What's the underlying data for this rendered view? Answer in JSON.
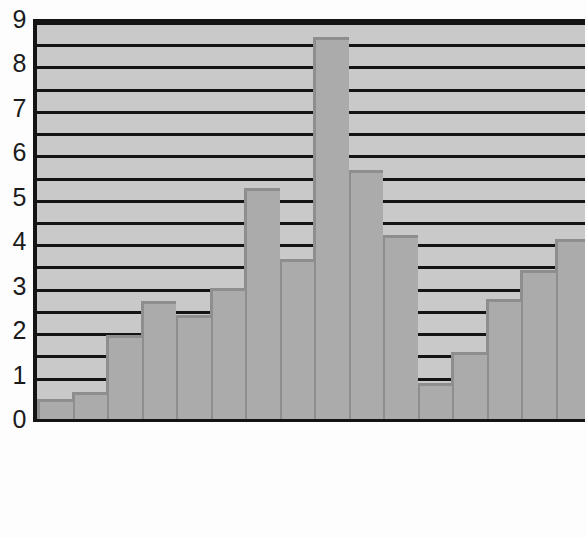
{
  "chart_data": {
    "type": "bar",
    "title": "",
    "subtitle": "",
    "xlabel": "",
    "ylabel": "",
    "categories": [
      "1821-1830",
      "1831-1840",
      "1841-1850",
      "1851-1860",
      "1861-1870",
      "1871-1880",
      "1881-1890",
      "1891-1900",
      "1901-1910",
      "1911-1920",
      "1921-1930",
      "1931-1940",
      "1941-1950",
      "1951-1960",
      "1961-1970",
      "1971-1980"
    ],
    "values": [
      0.45,
      0.6,
      1.9,
      2.65,
      2.35,
      2.95,
      5.2,
      3.6,
      8.6,
      5.6,
      4.15,
      0.8,
      1.5,
      2.7,
      3.35,
      4.05
    ],
    "ylim": [
      0,
      9
    ],
    "ytick_labels": [
      "0",
      "1",
      "2",
      "3",
      "4",
      "5",
      "6",
      "7",
      "8",
      "9"
    ],
    "ytick_values": [
      0,
      1,
      2,
      3,
      4,
      5,
      6,
      7,
      8,
      9
    ],
    "gridline_values": [
      0.5,
      1.0,
      1.5,
      2.0,
      2.5,
      3.0,
      3.5,
      4.0,
      4.5,
      5.0,
      5.5,
      6.0,
      6.5,
      7.0,
      7.5,
      8.0,
      8.5,
      9.0
    ],
    "grid": true,
    "legend": [],
    "legend_position": "none",
    "annotations": [],
    "colors": {
      "bar_fill": "#ababab",
      "bar_shade": "#8e8e8e",
      "plot_background": "#c9c9c9",
      "axis": "#141414",
      "gridline": "#141414",
      "text": "#1b1b1b",
      "page_background": "#fdfdfd"
    }
  }
}
